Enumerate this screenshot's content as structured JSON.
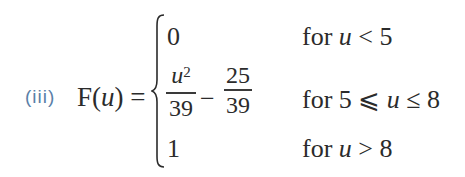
{
  "label": "(iii)",
  "lhs": {
    "func": "F",
    "open": "(",
    "var": "u",
    "close": ")",
    "equals": "="
  },
  "cases": [
    {
      "expr": "0",
      "condition": {
        "prefix": "for ",
        "var": "u",
        "rest": " < 5"
      }
    },
    {
      "expr": {
        "frac1": {
          "num_var": "u",
          "num_exp": "2",
          "den": "39"
        },
        "op": "−",
        "frac2": {
          "num": "25",
          "den": "39"
        }
      },
      "condition": {
        "prefix": "for 5 ⩽ ",
        "var": "u",
        "rest": " ≤ 8"
      }
    },
    {
      "expr": "1",
      "condition": {
        "prefix": "for ",
        "var": "u",
        "rest": " > 8"
      }
    }
  ],
  "colors": {
    "label": "#5a7fa8",
    "text": "#2b2b2b"
  }
}
